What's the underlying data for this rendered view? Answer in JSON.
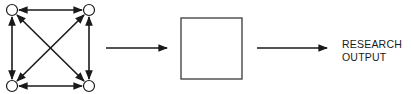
{
  "diagram": {
    "network": {
      "nodes": [
        {
          "id": "n1",
          "x": 12,
          "y": 10
        },
        {
          "id": "n2",
          "x": 89,
          "y": 10
        },
        {
          "id": "n3",
          "x": 12,
          "y": 86
        },
        {
          "id": "n4",
          "x": 89,
          "y": 86
        }
      ],
      "edges": [
        {
          "from": "n1",
          "to": "n2",
          "bidirectional": true
        },
        {
          "from": "n1",
          "to": "n3",
          "bidirectional": true
        },
        {
          "from": "n2",
          "to": "n4",
          "bidirectional": true
        },
        {
          "from": "n3",
          "to": "n4",
          "bidirectional": true
        },
        {
          "from": "n1",
          "to": "n4",
          "bidirectional": true
        },
        {
          "from": "n2",
          "to": "n3",
          "bidirectional": true
        }
      ]
    },
    "process_box": {
      "label": ""
    },
    "output": {
      "line1": "RESEARCH",
      "line2": "OUTPUT"
    },
    "colors": {
      "stroke": "#1a1a1a",
      "background": "#ffffff"
    }
  }
}
